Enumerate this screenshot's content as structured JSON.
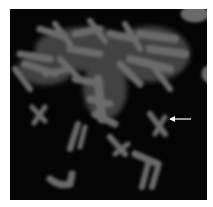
{
  "image": {
    "subject": "metaphase chromosome spread (grayscale fluorescence micrograph)",
    "background_color": "#050505",
    "frame_color": "#ffffff",
    "chromosome_color": "#6a6a6a",
    "annotation": {
      "type": "arrow",
      "color": "#ffffff",
      "direction": "left",
      "points_to": "isolated chromosome at right-center"
    }
  }
}
